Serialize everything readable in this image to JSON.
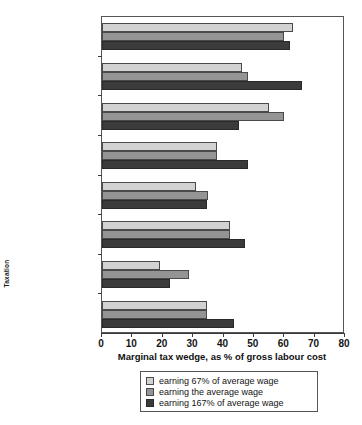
{
  "chart_data": {
    "type": "bar",
    "orientation": "horizontal",
    "title": "",
    "xlabel": "Marginal tax wedge, as % of gross labour cost",
    "ylabel": "Taxation",
    "xlim": [
      0,
      80
    ],
    "xticks": [
      0,
      10,
      20,
      30,
      40,
      50,
      60,
      70,
      80
    ],
    "grid": false,
    "legend_position": "below-center",
    "categories": [
      "France",
      "Sweden",
      "Germany",
      "United Kingdom",
      "Japan",
      "Turkey",
      "South Korea",
      "USA"
    ],
    "series": [
      {
        "name": "earning 67% of average wage",
        "color": "#d2d2d2",
        "values": [
          63,
          46,
          55,
          38,
          31,
          42,
          19,
          34.5
        ]
      },
      {
        "name": "earning the average wage",
        "color": "#949494",
        "values": [
          60,
          48,
          60,
          38,
          35,
          42,
          28.5,
          34.5
        ]
      },
      {
        "name": "earning 167% of average wage",
        "color": "#3b3b3b",
        "values": [
          62,
          66,
          45,
          48,
          34.5,
          47,
          22.5,
          43.5
        ]
      }
    ]
  },
  "legend": {
    "items": [
      {
        "label": "earning 67% of average wage"
      },
      {
        "label": "earning the average wage"
      },
      {
        "label": "earning 167% of average wage"
      }
    ]
  },
  "axes": {
    "x_title": "Marginal tax wedge, as % of gross labour cost",
    "y_title": "Taxation",
    "x_tick_labels": [
      "0",
      "10",
      "20",
      "30",
      "40",
      "50",
      "60",
      "70",
      "80"
    ]
  }
}
